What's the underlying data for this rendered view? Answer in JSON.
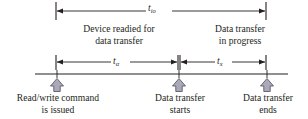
{
  "diagram": {
    "colors": {
      "line": "#231f20",
      "arrow_fill": "#a9a9b8",
      "arrow_stroke": "#5a5a6e",
      "background": "#ffffff"
    },
    "intervals": [
      {
        "id": "t-io",
        "symbol": "t",
        "subscript": "io",
        "description": "Total I/O operation time",
        "start_x": 56,
        "end_x": 266
      },
      {
        "id": "t-alpha",
        "symbol": "t",
        "subscript": "α",
        "description": "Device readied for data transfer",
        "start_x": 56,
        "end_x": 178
      },
      {
        "id": "t-x",
        "symbol": "t",
        "subscript": "x",
        "description": "Data transfer in progress",
        "start_x": 179,
        "end_x": 266
      }
    ],
    "phase_labels": [
      {
        "id": "device-readied",
        "line1": "Device readied for",
        "line2": "data transfer"
      },
      {
        "id": "transfer-progress",
        "line1": "Data transfer",
        "line2": "in progress"
      }
    ],
    "events": [
      {
        "id": "read-write-command",
        "line1": "Read/write command",
        "line2": "is issued",
        "marker_x": 57
      },
      {
        "id": "transfer-starts",
        "line1": "Data transfer",
        "line2": "starts",
        "marker_x": 179
      },
      {
        "id": "transfer-ends",
        "line1": "Data transfer",
        "line2": "ends",
        "marker_x": 267
      }
    ],
    "timeline": {
      "y": 74,
      "start_x": 35,
      "end_x": 288
    }
  }
}
